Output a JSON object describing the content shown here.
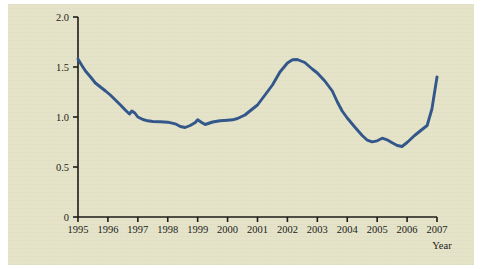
{
  "figure": {
    "background_color": "#e4e3c8",
    "page_color": "#ffffff",
    "axis_color": "#1c1c18",
    "line_color": "#33578a"
  },
  "chart_data": {
    "type": "line",
    "title": "",
    "xlabel": "Year",
    "ylabel": "",
    "xlim": [
      1995,
      2007
    ],
    "ylim": [
      0,
      2.0
    ],
    "grid": false,
    "legend": null,
    "x_tick_labels": [
      "1995",
      "1996",
      "1997",
      "1998",
      "1999",
      "2000",
      "2001",
      "2002",
      "2003",
      "2004",
      "2005",
      "2006",
      "2007"
    ],
    "x_ticks": [
      1995,
      1996,
      1997,
      1998,
      1999,
      2000,
      2001,
      2002,
      2003,
      2004,
      2005,
      2006,
      2007
    ],
    "y_tick_labels": [
      "0",
      "0.5",
      "1.0",
      "1.5",
      "2.0"
    ],
    "y_ticks": [
      0,
      0.5,
      1.0,
      1.5,
      2.0
    ],
    "series": [
      {
        "name": "value",
        "color": "#33578a",
        "x": [
          1995.0,
          1995.12,
          1995.25,
          1995.42,
          1995.58,
          1995.75,
          1995.92,
          1996.08,
          1996.25,
          1996.42,
          1996.58,
          1996.72,
          1996.8,
          1996.9,
          1997.0,
          1997.17,
          1997.33,
          1997.5,
          1997.75,
          1998.0,
          1998.25,
          1998.42,
          1998.58,
          1998.75,
          1998.92,
          1999.0,
          1999.12,
          1999.25,
          1999.5,
          1999.75,
          2000.0,
          2000.17,
          2000.33,
          2000.58,
          2000.83,
          2001.0,
          2001.25,
          2001.5,
          2001.75,
          2002.0,
          2002.17,
          2002.33,
          2002.58,
          2002.83,
          2003.0,
          2003.25,
          2003.5,
          2003.67,
          2003.83,
          2004.0,
          2004.25,
          2004.5,
          2004.67,
          2004.83,
          2005.0,
          2005.17,
          2005.33,
          2005.5,
          2005.67,
          2005.83,
          2006.0,
          2006.25,
          2006.5,
          2006.67,
          2006.83,
          2007.0
        ],
        "y": [
          1.58,
          1.52,
          1.46,
          1.4,
          1.34,
          1.3,
          1.26,
          1.22,
          1.17,
          1.12,
          1.07,
          1.03,
          1.06,
          1.04,
          1.0,
          0.975,
          0.962,
          0.955,
          0.952,
          0.948,
          0.932,
          0.905,
          0.895,
          0.915,
          0.945,
          0.972,
          0.948,
          0.925,
          0.95,
          0.962,
          0.968,
          0.972,
          0.985,
          1.02,
          1.08,
          1.12,
          1.22,
          1.32,
          1.45,
          1.54,
          1.572,
          1.575,
          1.545,
          1.48,
          1.44,
          1.36,
          1.26,
          1.15,
          1.06,
          0.99,
          0.9,
          0.815,
          0.768,
          0.752,
          0.762,
          0.788,
          0.772,
          0.742,
          0.715,
          0.705,
          0.745,
          0.815,
          0.875,
          0.915,
          1.08,
          1.4
        ]
      }
    ]
  }
}
